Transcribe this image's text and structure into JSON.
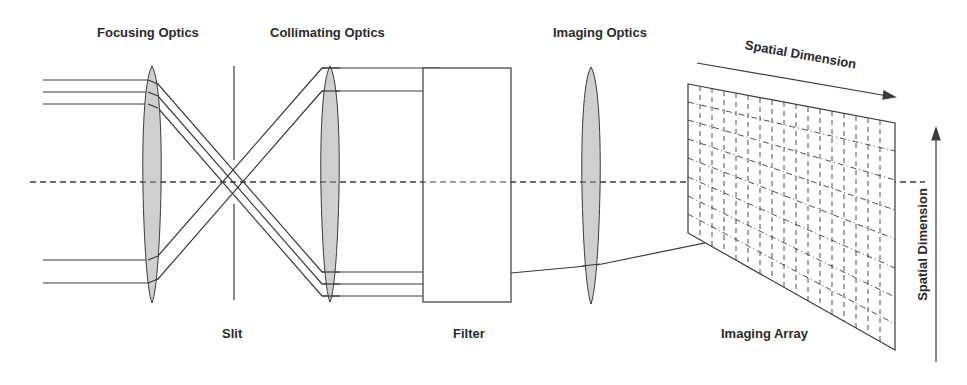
{
  "diagram": {
    "labels": {
      "focusing_optics": "Focusing Optics",
      "collimating_optics": "Collimating Optics",
      "imaging_optics": "Imaging Optics",
      "slit": "Slit",
      "filter": "Filter",
      "imaging_array": "Imaging Array",
      "spatial_dimension_horizontal": "Spatial Dimension",
      "spatial_dimension_vertical": "Spatial Dimension"
    },
    "components": [
      {
        "id": "focusing-lens",
        "type": "lens",
        "label": "Focusing Optics"
      },
      {
        "id": "slit",
        "type": "aperture",
        "label": "Slit"
      },
      {
        "id": "collimating-lens",
        "type": "lens",
        "label": "Collimating Optics"
      },
      {
        "id": "filter",
        "type": "filter",
        "label": "Filter"
      },
      {
        "id": "imaging-lens",
        "type": "lens",
        "label": "Imaging Optics"
      },
      {
        "id": "imaging-array",
        "type": "detector-grid",
        "label": "Imaging Array"
      }
    ],
    "colors": {
      "line": "#3a3a3a",
      "lens_fill": "#cfcfcf",
      "background": "#ffffff",
      "text": "#2a2a2a"
    }
  }
}
